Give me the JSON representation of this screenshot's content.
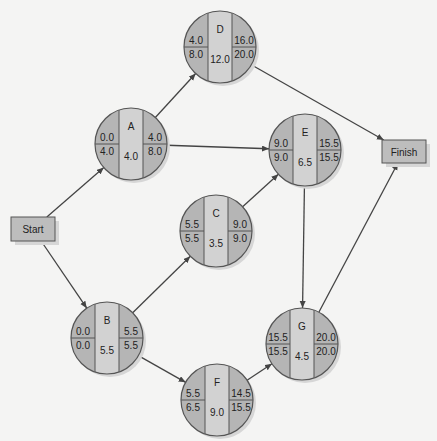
{
  "diagram": {
    "title": "",
    "colors": {
      "background": "#f4f4f3",
      "node_outer": "#b5b5b5",
      "node_center": "#d2d2d2",
      "box_fill": "#bdbdbd",
      "shadow": "#d6d6d6",
      "line": "#444444"
    },
    "start": {
      "label": "Start",
      "x": 11,
      "y": 217,
      "w": 44,
      "h": 24
    },
    "finish": {
      "label": "Finish",
      "x": 382,
      "y": 140,
      "w": 44,
      "h": 23
    },
    "nodes": [
      {
        "id": "D",
        "cx": 220,
        "cy": 47,
        "es": "4.0",
        "lf_top": "16.0",
        "ls": "8.0",
        "lf": "20.0",
        "duration": "12.0",
        "ef": "16.0"
      },
      {
        "id": "A",
        "cx": 131,
        "cy": 144,
        "es": "0.0",
        "ls": "4.0",
        "ef": "4.0",
        "lf": "8.0",
        "duration": "4.0"
      },
      {
        "id": "E",
        "cx": 305,
        "cy": 150,
        "es": "9.0",
        "ls": "9.0",
        "ef": "15.5",
        "lf": "15.5",
        "duration": "6.5"
      },
      {
        "id": "C",
        "cx": 216,
        "cy": 231,
        "es": "5.5",
        "ls": "5.5",
        "ef": "9.0",
        "lf": "9.0",
        "duration": "3.5"
      },
      {
        "id": "B",
        "cx": 107,
        "cy": 338,
        "es": "0.0",
        "ls": "0.0",
        "ef": "5.5",
        "lf": "5.5",
        "duration": "5.5"
      },
      {
        "id": "G",
        "cx": 302,
        "cy": 344,
        "es": "15.5",
        "ls": "15.5",
        "ef": "20.0",
        "lf": "20.0",
        "duration": "4.5"
      },
      {
        "id": "F",
        "cx": 217,
        "cy": 400,
        "es": "5.5",
        "ls": "6.5",
        "ef": "14.5",
        "lf": "15.5",
        "duration": "9.0"
      }
    ],
    "edges": [
      {
        "from": "Start",
        "to": "A"
      },
      {
        "from": "Start",
        "to": "B"
      },
      {
        "from": "A",
        "to": "D"
      },
      {
        "from": "A",
        "to": "E"
      },
      {
        "from": "B",
        "to": "C"
      },
      {
        "from": "B",
        "to": "F"
      },
      {
        "from": "C",
        "to": "E"
      },
      {
        "from": "D",
        "to": "Finish"
      },
      {
        "from": "E",
        "to": "G"
      },
      {
        "from": "F",
        "to": "G"
      },
      {
        "from": "G",
        "to": "Finish"
      }
    ]
  }
}
